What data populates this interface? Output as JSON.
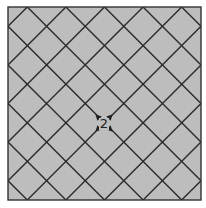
{
  "diagram": {
    "type": "tiled-square-diamond-grid",
    "grid_divisions": 5,
    "fill_color": "#bdbdbd",
    "line_color": "#2a2a2a",
    "border_color": "#333333",
    "square": {
      "x": 8,
      "y": 7,
      "size": 193
    },
    "label": {
      "text": "2",
      "x": 104,
      "y": 128
    },
    "arrows": [
      {
        "from": [
          104,
          123
        ],
        "to": [
          96,
          115
        ]
      },
      {
        "from": [
          104,
          123
        ],
        "to": [
          112,
          115
        ]
      },
      {
        "from": [
          104,
          123
        ],
        "to": [
          96,
          131
        ]
      },
      {
        "from": [
          104,
          123
        ],
        "to": [
          112,
          131
        ]
      }
    ]
  }
}
